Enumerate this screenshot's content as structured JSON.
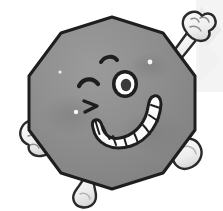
{
  "scene": {
    "title": "Cartoon Decagon Character",
    "description": "A smiling gray ten-sided polygon cartoon character with a winking eye, a wide toothy grin, two raised arms with clenched fists and two legs with rounded feet.",
    "canvas": {
      "width": 223,
      "height": 211
    },
    "background_color": "#ffffff"
  },
  "palette": {
    "body_fill": "#8d8d8d",
    "body_fill_light": "#9a9a9a",
    "body_shade": "#7d7d7d",
    "outline": "#1e1e1e",
    "limb_fill": "#f2f2f2",
    "limb_fill_shade": "#d8d8d8",
    "limb_outline": "#2a2a2a",
    "tooth_fill": "#fbfbfb",
    "pupil": "#3a3a3a",
    "eye_white": "#fdfdfd",
    "highlight": "#f5f5f5",
    "watermark": "#ececec"
  },
  "character": {
    "name": "decagon-character",
    "shape": {
      "name": "decagon-body",
      "sides": 10,
      "label": "Decagon",
      "center": {
        "x": 112,
        "y": 103
      },
      "radius": 86,
      "rotation_deg": 18,
      "fill": "#8d8d8d",
      "stroke": "#1e1e1e",
      "stroke_width": 3
    },
    "face": {
      "eyebrow": {
        "name": "left-eyebrow",
        "description": "short curved eyebrow above the winking eye"
      },
      "winking_eye": {
        "name": "winking-eye",
        "side": "left",
        "description": "closed arc eye (wink)",
        "center": {
          "x": 89,
          "y": 83
        }
      },
      "open_eye": {
        "name": "open-eye",
        "side": "right",
        "description": "round eye, white ring with dark pupil",
        "center": {
          "x": 124,
          "y": 83
        },
        "radius": 12,
        "pupil_radius": 6
      },
      "cheek_mark": {
        "name": "cheek-crease",
        "description": "small angular crease below the winking eye"
      },
      "mouth": {
        "name": "grin-mouth",
        "description": "wide curved open grin",
        "teeth_count": 9,
        "teeth_fill": "#fbfbfb"
      },
      "highlights": [
        {
          "name": "body-highlight-dot",
          "x": 150,
          "y": 62,
          "r": 2.4
        },
        {
          "name": "body-highlight-dot",
          "x": 76,
          "y": 112,
          "r": 2.2
        },
        {
          "name": "body-highlight-dot",
          "x": 60,
          "y": 72,
          "r": 1.6
        }
      ]
    },
    "limbs": [
      {
        "name": "upper-right-arm",
        "label": "Raised right arm with clenched fist",
        "position": "top-right",
        "has_fist": true
      },
      {
        "name": "left-arm",
        "label": "Flexed left arm with clenched fist",
        "position": "mid-left",
        "has_fist": true
      },
      {
        "name": "right-leg",
        "label": "Right leg with rounded foot",
        "position": "bottom-right",
        "has_fist": false
      },
      {
        "name": "bottom-leg",
        "label": "Left leg with rounded foot",
        "position": "bottom-center",
        "has_fist": false
      }
    ]
  },
  "watermark": {
    "name": "corner-watermark",
    "description": "faint light-gray arrow/chevron graphic in the top-right corner",
    "color": "#ececec",
    "position": "top-right",
    "visible": true
  }
}
